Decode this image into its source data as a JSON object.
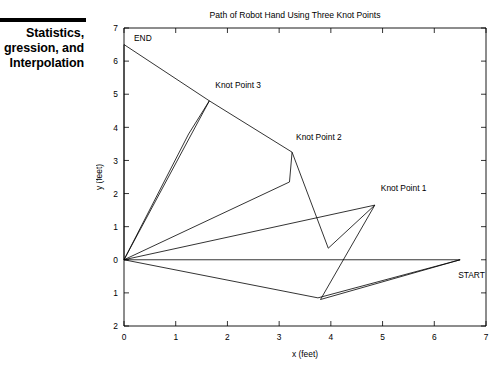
{
  "sidebar": {
    "banner_text": "Statistics,\ngression, and\nInterpolation",
    "rule": "divider"
  },
  "chart_data": {
    "type": "line",
    "title": "Path of Robot Hand Using Three Knot Points",
    "xlabel": "x (feet)",
    "ylabel": "y (feet)",
    "xlim": [
      0,
      7
    ],
    "ylim": [
      -2,
      7
    ],
    "xticks": [
      "0",
      "1",
      "2",
      "3",
      "4",
      "5",
      "6",
      "7"
    ],
    "xtick_values": [
      0,
      1,
      2,
      3,
      4,
      5,
      6,
      7
    ],
    "yticks": [
      "7",
      "6",
      "5",
      "4",
      "3",
      "2",
      "1",
      "0",
      "1",
      "2"
    ],
    "ytick_values": [
      7,
      6,
      5,
      4,
      3,
      2,
      1,
      0,
      -1,
      -2
    ],
    "grid": false,
    "legend": "none",
    "series": [
      {
        "name": "Robot hand path",
        "points": [
          [
            6.5,
            0.0
          ],
          [
            3.8,
            -1.2
          ],
          [
            4.85,
            1.65
          ],
          [
            3.95,
            0.35
          ],
          [
            3.25,
            3.25
          ],
          [
            3.2,
            2.35
          ],
          [
            0.0,
            0.0
          ],
          [
            1.65,
            4.8
          ],
          [
            1.25,
            3.8
          ],
          [
            0.0,
            0.0
          ],
          [
            0.0,
            6.5
          ]
        ]
      },
      {
        "name": "Chord lines from origin",
        "points": [
          [
            0.0,
            0.0
          ],
          [
            3.75,
            -1.15
          ],
          [
            6.5,
            0.0
          ],
          [
            0.0,
            0.0
          ],
          [
            4.85,
            1.65
          ]
        ]
      },
      {
        "name": "Chord end to knot 3",
        "points": [
          [
            0.0,
            6.5
          ],
          [
            1.65,
            4.8
          ],
          [
            3.25,
            3.25
          ]
        ]
      }
    ],
    "annotations": [
      {
        "label": "END",
        "x": 0.0,
        "y": 6.5,
        "dx": 10,
        "dy": -4
      },
      {
        "label": "START",
        "x": 6.5,
        "y": 0.0,
        "dx": -2,
        "dy": 18
      },
      {
        "label": "Knot Point 1",
        "x": 4.85,
        "y": 1.65,
        "dx": 6,
        "dy": -14
      },
      {
        "label": "Knot Point 2",
        "x": 3.25,
        "y": 3.25,
        "dx": 4,
        "dy": -12
      },
      {
        "label": "Knot Point 3",
        "x": 1.65,
        "y": 4.8,
        "dx": 6,
        "dy": -13
      }
    ]
  }
}
